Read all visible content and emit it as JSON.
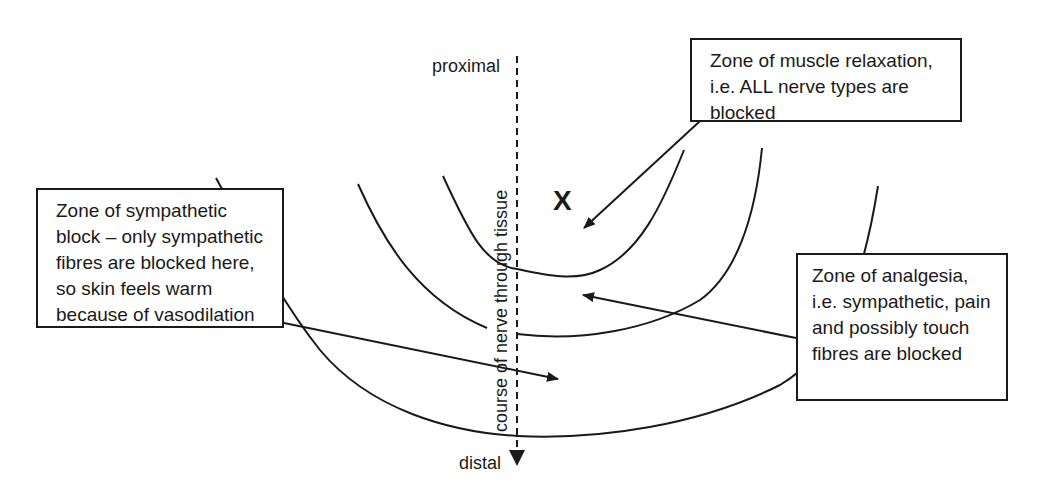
{
  "axis": {
    "top_label": "proximal",
    "bottom_label": "distal",
    "axis_label": "course of nerve through tissue"
  },
  "injection_marker": "X",
  "boxes": {
    "muscle_relaxation": "Zone of muscle relaxation, i.e. ALL nerve types are blocked",
    "sympathetic_block": "Zone of sympathetic block – only sympathetic fibres are blocked here, so skin feels warm because of vasodilation",
    "analgesia": "Zone of analgesia, i.e. sympathetic, pain and possibly touch fibres are blocked"
  },
  "colors": {
    "line": "#1a1a1a",
    "background": "#ffffff"
  }
}
